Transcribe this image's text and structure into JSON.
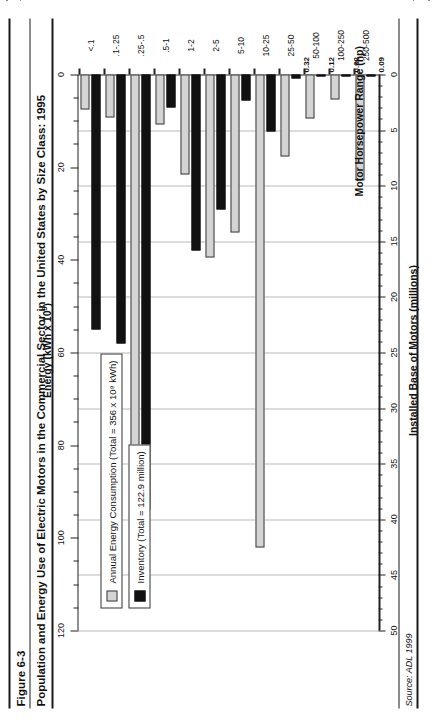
{
  "figure": {
    "number": "Figure 6-3",
    "title": "Population and Energy Use of Electric Motors in the Commercial Sector in the United States by Size Class: 1995",
    "source": "Source: ADL 1999"
  },
  "legend": {
    "inventory_label": "Inventory (Total = 122.9 million)",
    "energy_label": "Annual Energy Consumption (Total = 356 x 10⁹ kWh)"
  },
  "axes": {
    "bottom_title": "Installed Base of Motors (millions)",
    "top_title_pre": "Energy (kWh x 10",
    "top_title_sup": "9",
    "top_title_post": ")",
    "category_title": "Motor Horsepower Range (hp)",
    "bottom_ticks": [
      "0",
      "5",
      "10",
      "15",
      "20",
      "25",
      "30",
      "35",
      "40",
      "45",
      "50"
    ],
    "top_ticks": [
      "0",
      "20",
      "40",
      "60",
      "80",
      "100",
      "120"
    ]
  },
  "chart_data": {
    "type": "bar",
    "title": "Population and Energy Use of Electric Motors in the Commercial Sector in the United States by Size Class: 1995",
    "orientation": "horizontal",
    "xlabel": "Motor Horsepower Range (hp)",
    "ylabel": "Installed Base of Motors (millions)",
    "ylabel2": "Energy (kWh x 10^9)",
    "ylim": [
      0,
      50
    ],
    "ylim2": [
      0,
      120
    ],
    "grid": true,
    "legend_position": "left",
    "categories": [
      "<.1",
      ".1-.25",
      ".25-.5",
      ".5-1",
      "1-2",
      "2-5",
      "5-10",
      "10-25",
      "25-50",
      "50-100",
      "100-250",
      "250-500"
    ],
    "series": [
      {
        "name": "Inventory (Total = 122.9 million)",
        "unit": "millions",
        "axis": "bottom",
        "color": "#111111",
        "values": [
          22.9,
          24.2,
          39.1,
          3.0,
          15.8,
          12.1,
          2.3,
          5.1,
          0.32,
          0.12,
          0.02,
          0.09
        ],
        "labels": [
          "",
          "",
          "",
          "",
          "",
          "",
          "",
          "",
          "0.32",
          "0.12",
          "0.02",
          "0.09"
        ]
      },
      {
        "name": "Annual Energy Consumption (Total = 356 x 10^9 kWh)",
        "unit": "kWh x 10^9",
        "axis": "top",
        "color": "#d4d4d4",
        "values": [
          7.6,
          9.2,
          83.0,
          10.8,
          21.5,
          39.4,
          34.0,
          102.0,
          17.8,
          9.6,
          5.5,
          22.8
        ],
        "labels": [
          "",
          "",
          "",
          "",
          "",
          "",
          "",
          "",
          "",
          "",
          "",
          ""
        ]
      }
    ]
  },
  "colors": {
    "inventory": "#111111",
    "energy": "#d4d4d4",
    "grid": "#b9b9b9",
    "axis": "#222222"
  }
}
